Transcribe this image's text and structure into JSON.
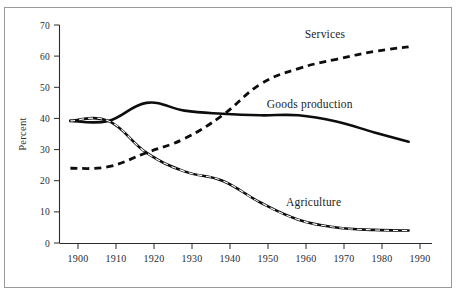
{
  "figure": {
    "background_color": "#ffffff",
    "border_color": "#9a9a9a",
    "ink_color": "#0d0d0d"
  },
  "chart_data": {
    "type": "line",
    "title": "",
    "xlabel": "",
    "ylabel": "Percent",
    "xlim": [
      1898,
      1992
    ],
    "ylim": [
      0,
      70
    ],
    "grid": false,
    "legend": "inline-annotations",
    "xticks": [
      "1900",
      "1910",
      "1920",
      "1930",
      "1940",
      "1950",
      "1960",
      "1970",
      "1980",
      "1990"
    ],
    "yticks": [
      "0",
      "10",
      "20",
      "30",
      "40",
      "50",
      "60",
      "70"
    ],
    "x": [
      1898,
      1908,
      1918,
      1928,
      1938,
      1948,
      1958,
      1968,
      1978,
      1987
    ],
    "series": [
      {
        "name": "Services",
        "style": "dashed",
        "label_x": 1965,
        "label_y": 66,
        "values": [
          24,
          24.5,
          29,
          33.5,
          41,
          51,
          56,
          59,
          61.5,
          63
        ]
      },
      {
        "name": "Goods production",
        "style": "solid",
        "label_x": 1961,
        "label_y": 43.5,
        "values": [
          39.2,
          39.2,
          45,
          42.5,
          41.5,
          41,
          41,
          39,
          35.5,
          32.5
        ]
      },
      {
        "name": "Agriculture",
        "style": "dashed-over-solid",
        "label_x": 1962,
        "label_y": 12,
        "values": [
          39.2,
          39.2,
          29,
          23,
          20,
          13,
          7.5,
          5,
          4.2,
          4
        ]
      }
    ]
  },
  "annotations": {
    "services_label": "Services",
    "goods_label": "Goods production",
    "agriculture_label": "Agriculture",
    "y_axis_title": "Percent"
  }
}
